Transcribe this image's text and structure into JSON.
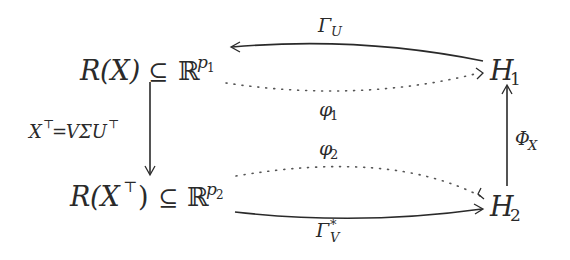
{
  "diagram": {
    "type": "commutative-diagram",
    "nodes": {
      "top_left": {
        "main": "R",
        "arg": "(X)",
        "rel": "⊆",
        "space": "ℝ",
        "sup": "p",
        "sup_sub": "1"
      },
      "bottom_left": {
        "main": "R",
        "arg_open": "(X",
        "arg_sup": "⊤",
        "arg_close": ")",
        "rel": "⊆",
        "space": "ℝ",
        "sup": "p",
        "sup_sub": "2"
      },
      "top_right": {
        "main": "H",
        "sub": "1"
      },
      "bottom_right": {
        "main": "H",
        "sub": "2"
      }
    },
    "edges": {
      "gamma_u": {
        "symbol": "Γ",
        "sub": "U",
        "from": "H1",
        "to": "R(X)",
        "style": "solid"
      },
      "phi1": {
        "symbol": "φ",
        "sub": "1",
        "from": "R(X)",
        "to": "H1",
        "style": "dotted"
      },
      "svd": {
        "lhs": "X",
        "lhs_sup": "⊤",
        "eq": "=",
        "rhs": "VΣU",
        "rhs_sup": "⊤",
        "from": "R(X)",
        "to": "R(X^T)",
        "style": "solid"
      },
      "phi2": {
        "symbol": "φ",
        "sub": "2",
        "from": "R(X^T)",
        "to": "H2",
        "style": "dotted"
      },
      "gamma_v": {
        "symbol": "Γ",
        "sub": "V",
        "sup": "*",
        "from": "R(X^T)",
        "to": "H2",
        "style": "solid"
      },
      "phi_x": {
        "symbol": "Φ",
        "sub": "X",
        "from": "H2",
        "to": "H1",
        "style": "solid"
      }
    }
  }
}
